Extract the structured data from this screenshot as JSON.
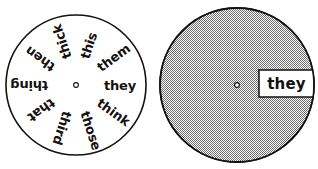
{
  "figure": {
    "background_color": "#ffffff",
    "ink_color": "#14110f"
  },
  "word_wheel": {
    "name": "word-wheel",
    "center": {
      "x": 76,
      "y": 85
    },
    "radius": 70,
    "pivot_label": "center pivot hole",
    "pivot_radius": 2.4,
    "words": [
      {
        "text": "they",
        "angle_deg": 0,
        "position": "right"
      },
      {
        "text": "them",
        "angle_deg": 324,
        "position": "upper-right"
      },
      {
        "text": "this",
        "angle_deg": 288,
        "position": "upper-right-inner"
      },
      {
        "text": "thick",
        "angle_deg": 252,
        "position": "top-left"
      },
      {
        "text": "then",
        "angle_deg": 216,
        "position": "upper-left"
      },
      {
        "text": "thing",
        "angle_deg": 180,
        "position": "left"
      },
      {
        "text": "that",
        "angle_deg": 144,
        "position": "lower-left"
      },
      {
        "text": "third",
        "angle_deg": 108,
        "position": "bottom-left"
      },
      {
        "text": "those",
        "angle_deg": 72,
        "position": "bottom-right"
      },
      {
        "text": "think",
        "angle_deg": 36,
        "position": "lower-right"
      }
    ]
  },
  "cover_disk": {
    "name": "cover-disk",
    "center": {
      "x": 237,
      "y": 85
    },
    "radius": 77,
    "fill_color": "#b8b8b8",
    "fill_pattern": "halftone-checker",
    "outline_color": "#1a1a1a",
    "pivot_label": "center pivot hole",
    "pivot_radius": 2.4,
    "window": {
      "name": "word-window",
      "visible_word": "they",
      "x": 259,
      "y": 70,
      "width": 55,
      "height": 27,
      "fill_color": "#ffffff"
    }
  }
}
